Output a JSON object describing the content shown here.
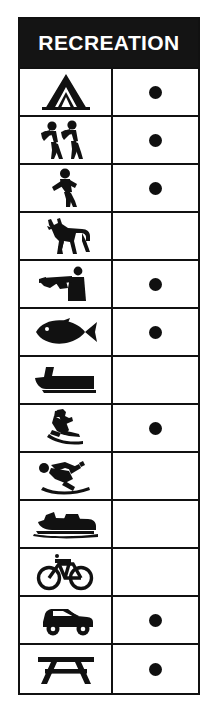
{
  "legend": {
    "header": {
      "title": "RECREATION",
      "background_color": "#141414",
      "text_color": "#FFFFFF"
    },
    "columns": [
      "symbol",
      "availability"
    ],
    "mark_glyph": "●",
    "mark_color": "#101010",
    "border_color": "#111111",
    "rows": [
      {
        "icon": "tent-camping-icon",
        "label": "Camping",
        "available": true
      },
      {
        "icon": "hikers-backpacking-icon",
        "label": "Backpacking",
        "available": true
      },
      {
        "icon": "walking-hiking-icon",
        "label": "Hiking",
        "available": true
      },
      {
        "icon": "horse-horseback-riding-icon",
        "label": "Horseback Riding",
        "available": false
      },
      {
        "icon": "hunter-rifle-icon",
        "label": "Hunting",
        "available": true
      },
      {
        "icon": "fish-fishing-icon",
        "label": "Fishing",
        "available": true
      },
      {
        "icon": "motorboat-boating-icon",
        "label": "Boating",
        "available": false
      },
      {
        "icon": "water-skier-icon",
        "label": "Water Skiing",
        "available": true
      },
      {
        "icon": "downhill-skier-icon",
        "label": "Downhill Skiing",
        "available": false
      },
      {
        "icon": "snowmobile-icon",
        "label": "Snowmobiling",
        "available": false
      },
      {
        "icon": "bicycle-icon",
        "label": "Bicycling",
        "available": false
      },
      {
        "icon": "off-road-vehicle-icon",
        "label": "Off-Road Vehicles",
        "available": true
      },
      {
        "icon": "picnic-table-icon",
        "label": "Picnicking",
        "available": true
      }
    ]
  }
}
